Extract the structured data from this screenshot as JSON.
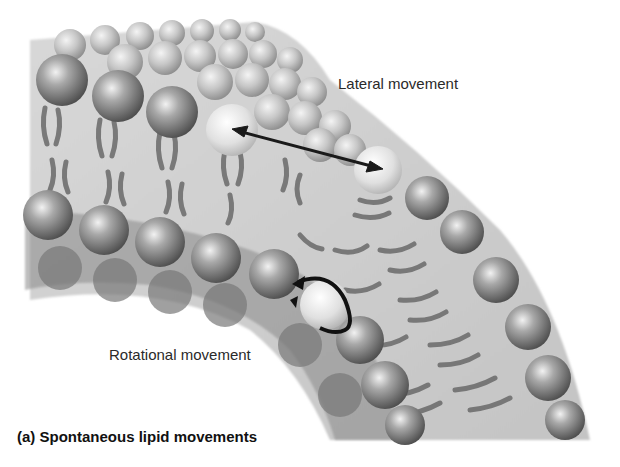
{
  "figure": {
    "caption": "(a) Spontaneous lipid movements",
    "labels": {
      "lateral": "Lateral movement",
      "rotational": "Rotational movement"
    },
    "arrows": [
      {
        "name": "lateral-movement-arrow",
        "type": "double-headed straight arrow"
      },
      {
        "name": "rotational-movement-arrow",
        "type": "curved circular arrow"
      }
    ],
    "colors": {
      "background": "#ffffff",
      "head_dark": "#5a5a5a",
      "head_light": "#d8d8d8",
      "highlight_head": "#e6e6e6",
      "tail": "#6a6a6a",
      "arrow": "#1a1a1a",
      "text": "#2a2a2a"
    }
  }
}
